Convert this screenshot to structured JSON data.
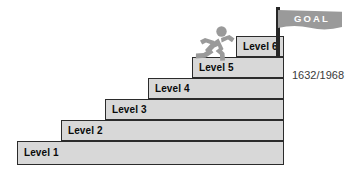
{
  "background_color": "#ffffff",
  "colors": {
    "step_fill": "#d8d8d8",
    "step_border": "#2b2b2b",
    "label_text": "#0a0a0a",
    "runner": "#9a9a9a",
    "flag_banner": "#9a9a9a",
    "flag_pole": "#262626",
    "goal_text": "#ffffff",
    "progress_text": "#3a3a3a"
  },
  "staircase": {
    "steps": [
      {
        "label": "Level 1",
        "left": 17,
        "top": 141,
        "width": 267,
        "height": 24
      },
      {
        "label": "Level 2",
        "left": 61,
        "top": 120,
        "width": 223,
        "height": 21
      },
      {
        "label": "Level 3",
        "left": 105,
        "top": 99,
        "width": 179,
        "height": 21
      },
      {
        "label": "Level 4",
        "left": 148,
        "top": 78,
        "width": 136,
        "height": 21
      },
      {
        "label": "Level 5",
        "left": 192,
        "top": 57,
        "width": 92,
        "height": 21
      },
      {
        "label": "Level 6",
        "left": 236,
        "top": 36,
        "width": 48,
        "height": 21
      }
    ]
  },
  "runner": {
    "icon": "running-person-icon"
  },
  "flag": {
    "goal_label": "GOAL",
    "pole_icon": "flag-pole-icon",
    "banner_icon": "flag-banner-icon"
  },
  "progress": {
    "text": "1632/1968",
    "current": 1632,
    "total": 1968
  }
}
